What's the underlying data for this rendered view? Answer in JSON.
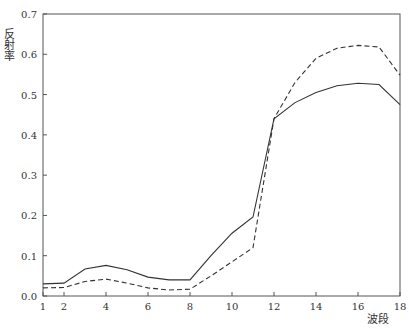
{
  "chart_data": {
    "type": "line",
    "title": "",
    "xlabel": "波段",
    "ylabel": "反射率",
    "x": [
      1,
      2,
      3,
      4,
      5,
      6,
      7,
      8,
      9,
      10,
      11,
      12,
      13,
      14,
      15,
      16,
      17,
      18
    ],
    "xticks": [
      1,
      2,
      4,
      6,
      8,
      10,
      12,
      14,
      16,
      18
    ],
    "yticks": [
      0.0,
      0.1,
      0.2,
      0.3,
      0.4,
      0.5,
      0.6,
      0.7
    ],
    "ytick_labels": [
      "0.0",
      "0.1",
      "0.2",
      "0.3",
      "0.4",
      "0.5",
      "0.6",
      "0.7"
    ],
    "xlim": [
      1,
      18
    ],
    "ylim": [
      0,
      0.7
    ],
    "grid": false,
    "legend": null,
    "series": [
      {
        "name": "solid",
        "style": "solid",
        "color": "#333333",
        "values": [
          0.03,
          0.032,
          0.067,
          0.076,
          0.065,
          0.047,
          0.04,
          0.04,
          0.1,
          0.156,
          0.196,
          0.44,
          0.48,
          0.505,
          0.522,
          0.528,
          0.525,
          0.475
        ]
      },
      {
        "name": "dashed",
        "style": "dashed",
        "color": "#333333",
        "values": [
          0.02,
          0.021,
          0.036,
          0.042,
          0.032,
          0.02,
          0.015,
          0.017,
          0.05,
          0.085,
          0.12,
          0.44,
          0.53,
          0.59,
          0.615,
          0.622,
          0.618,
          0.548
        ]
      }
    ]
  }
}
